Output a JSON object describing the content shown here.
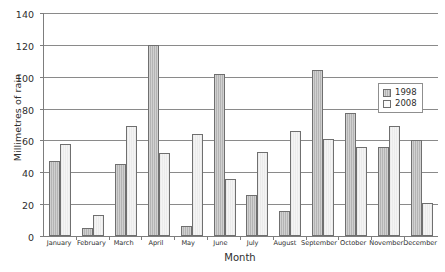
{
  "chart_data": {
    "type": "bar",
    "title": "",
    "xlabel": "Month",
    "ylabel": "Millimetres of rain",
    "ylim": [
      0,
      140
    ],
    "ytick_values": [
      0,
      20,
      40,
      60,
      80,
      100,
      120,
      140
    ],
    "ytick_labels": [
      "0",
      "20",
      "40",
      "60",
      "80",
      "100",
      "120",
      "140"
    ],
    "grid": true,
    "legend_position": "upper right",
    "categories": [
      "January",
      "February",
      "March",
      "April",
      "May",
      "June",
      "July",
      "August",
      "September",
      "October",
      "November",
      "December"
    ],
    "series": [
      {
        "name": "1998",
        "color": "#b4b4b4",
        "values": [
          47,
          5,
          45,
          120,
          6,
          102,
          26,
          16,
          104,
          77,
          56,
          60
        ]
      },
      {
        "name": "2008",
        "color": "#f4f4f4",
        "values": [
          58,
          13,
          69,
          52,
          64,
          36,
          53,
          66,
          61,
          56,
          69,
          21
        ]
      }
    ]
  }
}
